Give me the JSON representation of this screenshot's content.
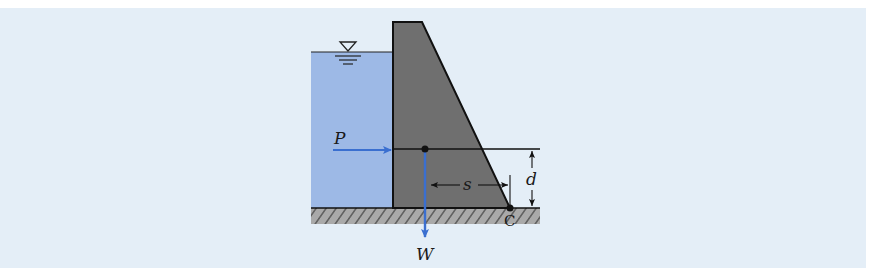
{
  "diagram": {
    "type": "gravity dam free-body diagram",
    "labels": {
      "pressure_force": "P",
      "weight_force": "W",
      "moment_arm": "s",
      "height": "d",
      "pivot_point": "C"
    },
    "colors": {
      "background": "#e4eef7",
      "water": "#9bb8e6",
      "dam": "#6f6f6f",
      "ground": "#a8a8a8",
      "force_arrow": "#3a6fd0",
      "outline": "#111111"
    }
  }
}
